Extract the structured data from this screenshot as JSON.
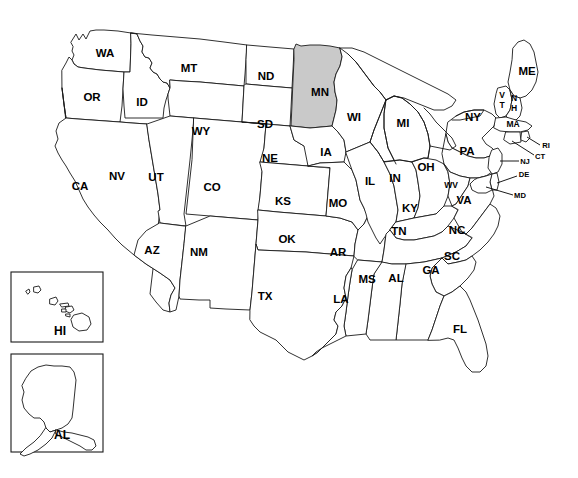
{
  "figure": {
    "type": "choropleth-locator-map",
    "highlighted_state_code": "MN",
    "highlighted_state_name": "Minnesota",
    "highlight_color": "#c9c9c9",
    "default_state_color": "#ffffff",
    "border_color": "#1a1a1a",
    "background_color": "#ffffff"
  },
  "labels": {
    "WA": "WA",
    "OR": "OR",
    "ID": "ID",
    "MT": "MT",
    "ND": "ND",
    "MN": "MN",
    "WI": "WI",
    "MI": "MI",
    "ME": "ME",
    "NY": "NY",
    "SD": "SD",
    "WY": "WY",
    "IA": "IA",
    "NE": "NE",
    "CA": "CA",
    "NV": "NV",
    "UT": "UT",
    "CO": "CO",
    "KS": "KS",
    "IL": "IL",
    "IN": "IN",
    "OH": "OH",
    "PA": "PA",
    "MO": "MO",
    "KY": "KY",
    "WV": "WV",
    "VA": "VA",
    "AZ": "AZ",
    "NM": "NM",
    "OK": "OK",
    "AR": "AR",
    "TN": "TN",
    "NC": "NC",
    "SC": "SC",
    "TX": "TX",
    "LA": "LA",
    "MS": "MS",
    "AL_state": "AL",
    "GA": "GA",
    "FL": "FL",
    "VT_line1": "V",
    "VT_line2": "T",
    "NH_line1": "N",
    "NH_line2": "H",
    "MA": "MA",
    "RI": "RI",
    "CT": "CT",
    "NJ": "NJ",
    "DE": "DE",
    "MD": "MD",
    "HI": "HI",
    "AK_as_shown": "AL"
  },
  "insets": [
    {
      "name": "hawaii-inset",
      "label": "HI"
    },
    {
      "name": "alaska-inset",
      "label": "AL"
    }
  ],
  "callout_labels": [
    "RI",
    "CT",
    "NJ",
    "DE",
    "MD"
  ],
  "stacked_labels": [
    "VT",
    "NH"
  ]
}
